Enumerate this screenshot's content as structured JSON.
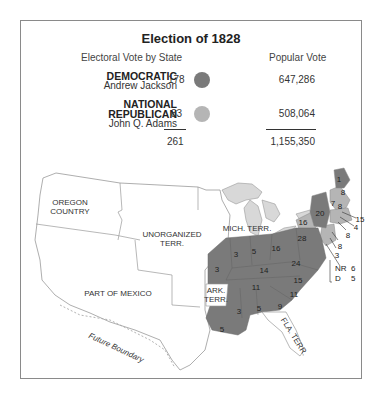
{
  "title": "Election of 1828",
  "headers": {
    "electoral": "Electoral Vote by State",
    "popular": "Popular Vote"
  },
  "parties": [
    {
      "party": "DEMOCRATIC",
      "candidate": "Andrew Jackson",
      "electoral": "178",
      "popular": "647,286",
      "color": "#7a7a7a"
    },
    {
      "party_line1": "NATIONAL",
      "party_line2": "REPUBLICAN",
      "candidate": "John Q. Adams",
      "electoral": "83",
      "popular": "508,064",
      "color": "#b5b5b5"
    }
  ],
  "totals": {
    "electoral": "261",
    "popular": "1,155,350"
  },
  "map": {
    "regions": {
      "oregon": "OREGON COUNTRY",
      "oregon_l1": "OREGON",
      "oregon_l2": "COUNTRY",
      "unorg_l1": "UNORGANIZED",
      "unorg_l2": "TERR.",
      "mexico": "PART OF MEXICO",
      "mich": "MICH. TERR.",
      "ark_l1": "ARK.",
      "ark_l2": "TERR.",
      "fla": "FLA. TERR.",
      "future": "Future Boundary"
    },
    "state_votes": {
      "maine": "1",
      "maine2": "8",
      "vt": "7",
      "nh": "8",
      "ny": "20",
      "ny_west": "16",
      "mass": "15",
      "ri": "4",
      "ct": "8",
      "nj": "8",
      "del": "3",
      "pa": "28",
      "ohio": "16",
      "ind": "5",
      "ill": "3",
      "mo": "3",
      "ky": "14",
      "va": "24",
      "nc": "15",
      "tn": "11",
      "sc": "11",
      "ga": "9",
      "ala": "5",
      "miss": "3",
      "la": "5"
    },
    "md_split": {
      "nr_label": "NR",
      "nr": "6",
      "d_label": "D",
      "d": "5"
    }
  },
  "colors": {
    "democratic": "#7a7a7a",
    "national_republican": "#b5b5b5",
    "border": "#8a8a8a"
  }
}
